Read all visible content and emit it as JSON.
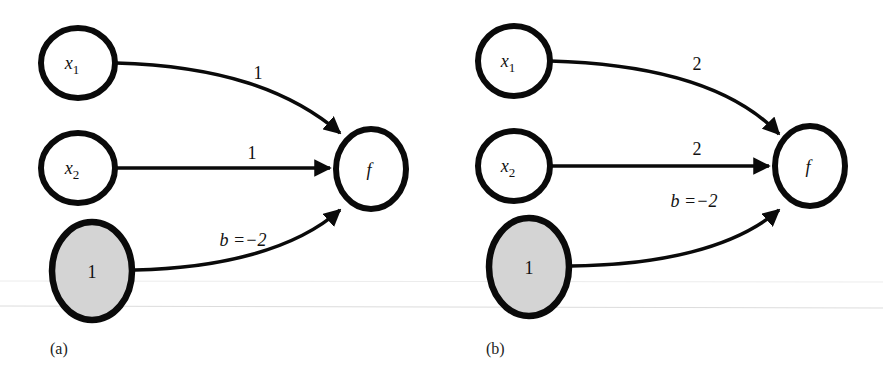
{
  "colors": {
    "stroke": "#0a0a0a",
    "bias_fill": "#d4d4d4",
    "node_fill": "#ffffff",
    "faint_line": "#e2e2e2"
  },
  "panels": [
    {
      "caption": "(a)",
      "nodes": {
        "x1": {
          "var": "x",
          "sub": "1"
        },
        "x2": {
          "var": "x",
          "sub": "2"
        },
        "bias": {
          "label": "1"
        },
        "output": {
          "label": "f"
        }
      },
      "edges": {
        "x1_to_f": "1",
        "x2_to_f": "1",
        "bias_to_f": "b =−2"
      }
    },
    {
      "caption": "(b)",
      "nodes": {
        "x1": {
          "var": "x",
          "sub": "1"
        },
        "x2": {
          "var": "x",
          "sub": "2"
        },
        "bias": {
          "label": "1"
        },
        "output": {
          "label": "f"
        }
      },
      "edges": {
        "x1_to_f": "2",
        "x2_to_f": "2",
        "bias_to_f": "b =−2"
      }
    }
  ]
}
